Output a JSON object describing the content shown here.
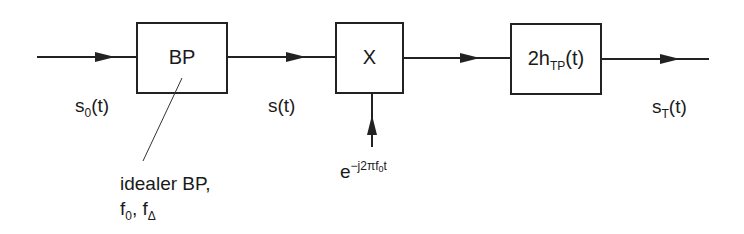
{
  "diagram": {
    "blocks": [
      {
        "id": "bp",
        "label": "BP"
      },
      {
        "id": "mixer",
        "label": "X"
      },
      {
        "id": "lowpass",
        "label_main": "2h",
        "label_sub": "TP",
        "label_tail": "(t)"
      }
    ],
    "signals": {
      "input": {
        "main": "s",
        "sub": "0",
        "tail": "(t)"
      },
      "after_bp": {
        "main": "s(t)"
      },
      "output": {
        "main": "s",
        "sub": "T",
        "tail": "(t)"
      }
    },
    "mixer_input": {
      "base": "e",
      "exponent": "−j2πf",
      "exp_sub": "0",
      "exp_tail": "t"
    },
    "annotation": {
      "line1": "idealer BP,",
      "f0_main": "f",
      "f0_sub": "0",
      "sep": ", ",
      "fd_main": "f",
      "fd_sub": "Δ"
    },
    "colors": {
      "stroke": "#222222",
      "background": "#ffffff"
    }
  }
}
